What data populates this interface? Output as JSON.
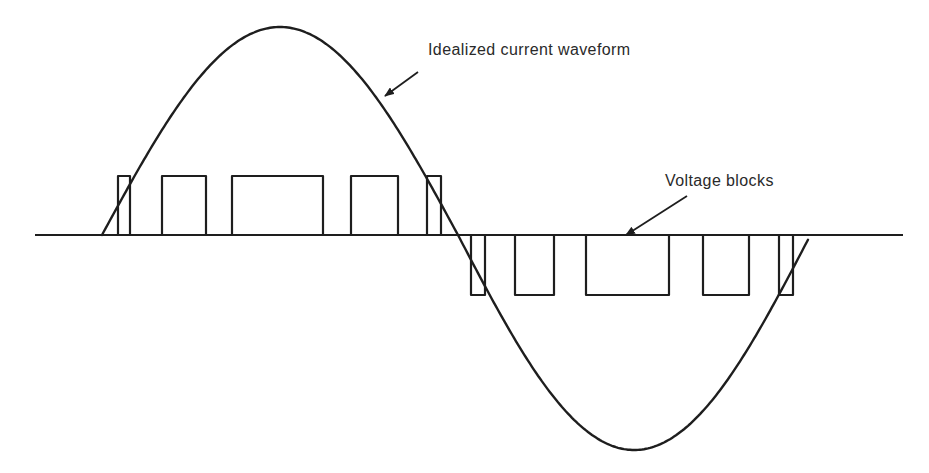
{
  "figure": {
    "type": "waveform-diagram",
    "labels": {
      "current": "Idealized current waveform",
      "voltage": "Voltage blocks"
    },
    "colors": {
      "stroke": "#1e1e1e",
      "background": "#ffffff",
      "text": "#2a2a2a"
    }
  },
  "geometry": {
    "baseline": {
      "x1": 35,
      "x2": 903,
      "y": 235
    },
    "curve": {
      "x_start": 102,
      "x_zero": 458,
      "x_end": 808,
      "peak_y": 27,
      "trough_y": 450
    },
    "positive_blocks": [
      {
        "x1": 118,
        "x2": 130,
        "top": 176
      },
      {
        "x1": 162,
        "x2": 206,
        "top": 176
      },
      {
        "x1": 232,
        "x2": 323,
        "top": 176
      },
      {
        "x1": 351,
        "x2": 398,
        "top": 176
      },
      {
        "x1": 427,
        "x2": 441,
        "top": 176
      }
    ],
    "negative_blocks": [
      {
        "x1": 471,
        "x2": 485,
        "bottom": 295
      },
      {
        "x1": 515,
        "x2": 554,
        "bottom": 295
      },
      {
        "x1": 586,
        "x2": 669,
        "bottom": 295
      },
      {
        "x1": 703,
        "x2": 749,
        "bottom": 295
      },
      {
        "x1": 779,
        "x2": 793,
        "bottom": 295
      }
    ],
    "arrows": [
      {
        "name": "current-arrow",
        "x1": 418,
        "y1": 72,
        "x2": 385,
        "y2": 96
      },
      {
        "name": "voltage-arrow",
        "x1": 687,
        "y1": 196,
        "x2": 626,
        "y2": 235
      }
    ]
  }
}
